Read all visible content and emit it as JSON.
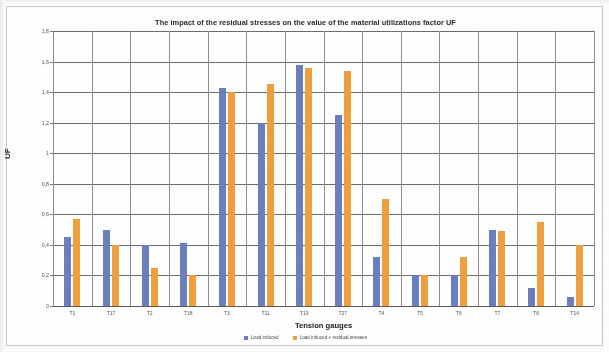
{
  "chart_data": {
    "type": "bar",
    "title": "The impact of the residual stresses on the value of the material utilizations factor UF",
    "xlabel": "Tension gauges",
    "ylabel": "UF",
    "ylim": [
      0,
      1.8
    ],
    "ytick_step": 0.2,
    "ytick_labels": [
      "0",
      "0,2",
      "0,4",
      "0,6",
      "0,8",
      "1",
      "1,2",
      "1,4",
      "1,6",
      "1,8"
    ],
    "ytick_values": [
      0,
      0.2,
      0.4,
      0.6,
      0.8,
      1.0,
      1.2,
      1.4,
      1.6,
      1.8
    ],
    "grid": "horizontal-and-vertical",
    "legend_position": "bottom",
    "categories": [
      "T1",
      "T17",
      "T2",
      "T18",
      "T3",
      "T11",
      "T19",
      "T27",
      "T4",
      "T5",
      "T6",
      "T7",
      "T8",
      "T14"
    ],
    "series": [
      {
        "name": "Load induced",
        "color": "#6b7fc0",
        "values": [
          0.45,
          0.5,
          0.4,
          0.41,
          1.43,
          1.2,
          1.58,
          1.25,
          0.32,
          0.2,
          0.2,
          0.5,
          0.12,
          0.06
        ]
      },
      {
        "name": "Load induced + residual stresses",
        "color": "#f0a03c",
        "values": [
          0.57,
          0.4,
          0.25,
          0.2,
          1.4,
          1.45,
          1.56,
          1.54,
          0.7,
          0.2,
          0.32,
          0.49,
          0.55,
          0.4
        ]
      }
    ]
  }
}
